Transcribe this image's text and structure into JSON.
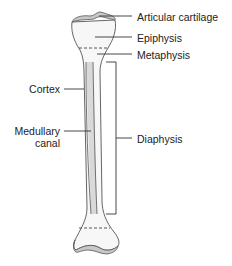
{
  "diagram": {
    "colors": {
      "bone_fill": "#f7f7f7",
      "cartilage_fill": "#c8c8c8",
      "canal_fill": "#d9d9d9",
      "outline": "#555555",
      "leader_line": "#333333",
      "text": "#222222"
    },
    "labels": {
      "articular_cartilage": "Articular cartilage",
      "epiphysis": "Epiphysis",
      "metaphysis": "Metaphysis",
      "diaphysis": "Diaphysis",
      "cortex": "Cortex",
      "medullary_canal_line1": "Medullary",
      "medullary_canal_line2": "canal"
    }
  }
}
